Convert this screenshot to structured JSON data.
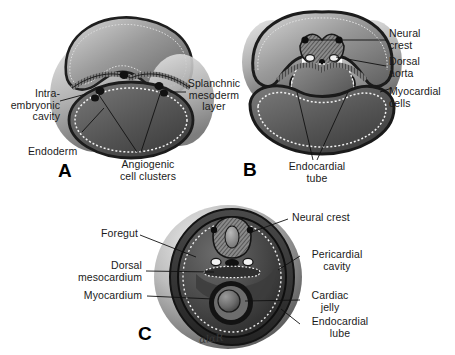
{
  "figure": {
    "background_color": "#ffffff",
    "signature": "ɑlɑR",
    "panels": [
      {
        "id": "A",
        "letter": "A",
        "caption": "Early stage: bilateral angiogenic cell clusters within splanchnic mesoderm above the endoderm-lined yolk sac",
        "labels": [
          {
            "name": "intraembryonic-cavity",
            "text": "Intra-\nembryonic\ncavity"
          },
          {
            "name": "endoderm",
            "text": "Endoderm"
          },
          {
            "name": "splanchnic-mesoderm-layer",
            "text": "Splanchnic\nmesoderm\nlayer"
          },
          {
            "name": "angiogenic-cell-clusters",
            "text": "Angiogenic\ncell clusters"
          }
        ]
      },
      {
        "id": "B",
        "letter": "B",
        "caption": "Paired endocardial tubes form beneath the neural folds, flanked by dorsal aortae and myocardial cells",
        "labels": [
          {
            "name": "neural-crest",
            "text": "Neural\ncrest"
          },
          {
            "name": "dorsal-aorta",
            "text": "Dorsal\naorta"
          },
          {
            "name": "myocardial-cells",
            "text": "Myocardial\ncells"
          },
          {
            "name": "endocardial-tube",
            "text": "Endocardial\ntube"
          }
        ]
      },
      {
        "id": "C",
        "letter": "C",
        "caption": "Fused single heart tube suspended by the dorsal mesocardium within the pericardial cavity",
        "labels": [
          {
            "name": "foregut",
            "text": "Foregut"
          },
          {
            "name": "dorsal-mesocardium",
            "text": "Dorsal\nmesocardium"
          },
          {
            "name": "myocardium",
            "text": "Myocardium"
          },
          {
            "name": "neural-crest",
            "text": "Neural crest"
          },
          {
            "name": "pericardial-cavity",
            "text": "Pericardial\ncavity"
          },
          {
            "name": "cardiac-jelly",
            "text": "Cardiac\njelly"
          },
          {
            "name": "endocardial-tube",
            "text": "Endocardial\nlube"
          }
        ]
      }
    ]
  }
}
